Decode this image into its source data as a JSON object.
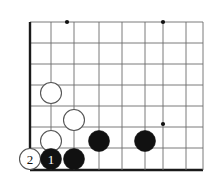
{
  "diagram": {
    "kind": "go-board-diagram",
    "title": "",
    "board_region": "bottom-left corner",
    "colors": {
      "background": "#ffffff",
      "grid_line": "#6b6b6b",
      "edge_line": "#1a1a1a",
      "black_stone": "#111111",
      "white_stone_fill": "#ffffff",
      "white_stone_edge": "#555555",
      "star_point": "#111111",
      "black_label_text": "#ffffff",
      "white_label_text": "#111111"
    },
    "geometry": {
      "columns_x": [
        30,
        51,
        74,
        99,
        122,
        145,
        163,
        186,
        203
      ],
      "rows_y": [
        22,
        43,
        64,
        85,
        106,
        127,
        148,
        170
      ],
      "stone_radius": 10.5,
      "edge_thickness": 2.4,
      "grid_thickness": 0.9
    },
    "star_points": [
      {
        "name": "star-point-upper-left",
        "x": 67,
        "y": 22
      },
      {
        "name": "star-point-upper-right",
        "x": 163,
        "y": 22
      },
      {
        "name": "star-point-lower-right",
        "x": 163,
        "y": 124
      }
    ],
    "stones": [
      {
        "name": "white-stone-a",
        "color": "white",
        "label": "",
        "x": 51,
        "y": 93
      },
      {
        "name": "white-stone-b",
        "color": "white",
        "label": "",
        "x": 74,
        "y": 120
      },
      {
        "name": "white-stone-c",
        "color": "white",
        "label": "",
        "x": 51,
        "y": 141
      },
      {
        "name": "white-stone-move-2",
        "color": "white",
        "label": "2",
        "x": 30,
        "y": 159
      },
      {
        "name": "black-stone-move-1",
        "color": "black",
        "label": "1",
        "x": 51,
        "y": 159
      },
      {
        "name": "black-stone-d",
        "color": "black",
        "label": "",
        "x": 74,
        "y": 159
      },
      {
        "name": "black-stone-e",
        "color": "black",
        "label": "",
        "x": 99,
        "y": 141
      },
      {
        "name": "black-stone-f",
        "color": "black",
        "label": "",
        "x": 145,
        "y": 141
      }
    ],
    "move_labels": [
      {
        "name": "move-label-1",
        "text": "1",
        "on": "black"
      },
      {
        "name": "move-label-2",
        "text": "2",
        "on": "white"
      }
    ]
  }
}
